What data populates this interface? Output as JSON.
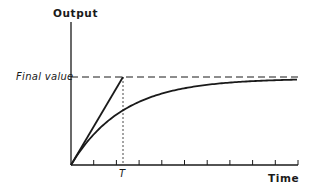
{
  "chart_data": {
    "type": "line",
    "title": "",
    "xlabel": "Time",
    "ylabel": "Output",
    "ylim": [
      0,
      1
    ],
    "xlim": [
      0,
      8
    ],
    "grid": false,
    "legend": null,
    "annotations": {
      "final_value_label": "Final value",
      "time_constant_label": "T",
      "final_value": 1.0,
      "time_constant": 1.0
    },
    "x_ticks": [
      1,
      2,
      3,
      4,
      5,
      6,
      7,
      8
    ],
    "series": [
      {
        "name": "Step response",
        "style": "solid",
        "x": [
          0,
          0.25,
          0.5,
          0.75,
          1,
          1.5,
          2,
          2.5,
          3,
          4,
          5,
          6,
          7,
          8
        ],
        "values": [
          0,
          0.221,
          0.393,
          0.528,
          0.632,
          0.777,
          0.865,
          0.918,
          0.95,
          0.982,
          0.993,
          0.998,
          0.999,
          1.0
        ]
      },
      {
        "name": "Initial slope tangent",
        "style": "solid",
        "x": [
          0,
          1
        ],
        "values": [
          0,
          1.0
        ]
      },
      {
        "name": "Final value line",
        "style": "dashed",
        "x": [
          0,
          8
        ],
        "values": [
          1.0,
          1.0
        ]
      },
      {
        "name": "T marker",
        "style": "dotted",
        "x": [
          1,
          1
        ],
        "values": [
          0,
          1.0
        ]
      }
    ]
  },
  "colors": {
    "ink": "#1a1a1a",
    "background": "#ffffff"
  }
}
